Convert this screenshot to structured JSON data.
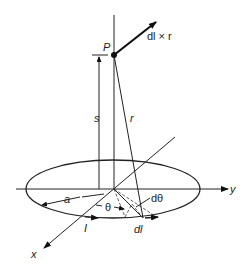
{
  "diagram": {
    "labels": {
      "point": "P",
      "cross_product": "dl × r",
      "height": "s",
      "distance": "r",
      "radius": "a",
      "angle": "θ",
      "dangle": "dθ",
      "current": "I",
      "element": "dl",
      "x_axis": "x",
      "y_axis": "y"
    },
    "colors": {
      "stroke": "#222222",
      "background": "#ffffff"
    }
  }
}
